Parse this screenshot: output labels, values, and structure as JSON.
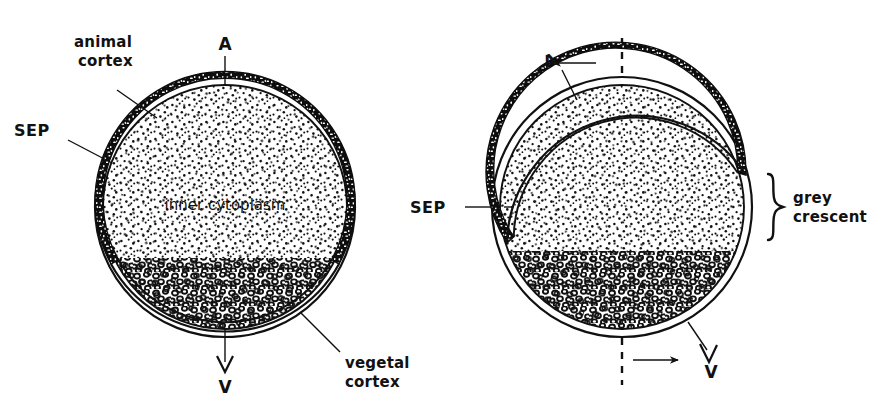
{
  "figure": {
    "background_color": "#ffffff",
    "ink_color": "#111111",
    "panels": [
      {
        "id": "before-rotation",
        "name": "left-panel",
        "center_x": 225,
        "center_y": 207,
        "radius": 130,
        "labels": {
          "animal_pole": "A",
          "vegetal_pole": "V",
          "animal_cortex": "animal cortex",
          "vegetal_cortex": "vegetal cortex",
          "sep": "SEP",
          "inner_cytoplasm": "inner cytoplasm"
        }
      },
      {
        "id": "after-rotation",
        "name": "right-panel",
        "center_x": 622,
        "center_y": 207,
        "radius": 130,
        "rotation_degrees": 30,
        "labels": {
          "animal_pole": "A",
          "vegetal_pole": "V",
          "sep": "SEP",
          "grey_crescent": "grey crescent"
        },
        "arrows": {
          "top_direction": "left",
          "bottom_direction": "right"
        },
        "reference_axis": "dashed-vertical"
      }
    ],
    "legend_terms": [
      "animal cortex",
      "vegetal cortex",
      "inner cytoplasm",
      "SEP",
      "grey crescent",
      "A",
      "V"
    ]
  }
}
